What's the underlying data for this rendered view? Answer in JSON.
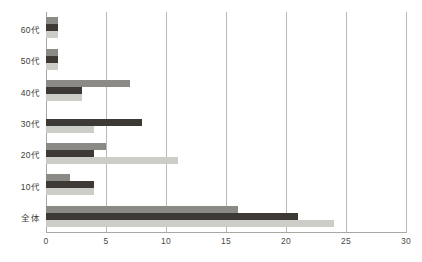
{
  "chart_data": {
    "type": "bar",
    "orientation": "horizontal",
    "title": "",
    "subtitle": "",
    "xlabel": "",
    "ylabel": "",
    "xlim": [
      0,
      30
    ],
    "x_ticks": [
      "0",
      "5",
      "10",
      "15",
      "20",
      "25",
      "30"
    ],
    "x_tick_values": [
      0,
      5,
      10,
      15,
      20,
      25,
      30
    ],
    "grid": "vertical",
    "legend": "none",
    "categories": [
      "60代",
      "50代",
      "40代",
      "30代",
      "20代",
      "10代",
      "全体"
    ],
    "series": [
      {
        "name": "series-1",
        "color": "#8c8a85",
        "values": [
          1,
          1,
          7,
          0,
          5,
          2,
          16
        ]
      },
      {
        "name": "series-2",
        "color": "#3d3a36",
        "values": [
          1,
          1,
          3,
          8,
          4,
          4,
          21
        ]
      },
      {
        "name": "series-3",
        "color": "#cdcdc8",
        "values": [
          1,
          1,
          3,
          4,
          11,
          4,
          24
        ]
      }
    ]
  },
  "colors": {
    "background": "#ffffff",
    "gridline": "#b9b9b4",
    "axis": "#a8a8a3",
    "text": "#3c3c38",
    "series_1": "#8c8a85",
    "series_2": "#3d3a36",
    "series_3": "#cdcdc8"
  }
}
